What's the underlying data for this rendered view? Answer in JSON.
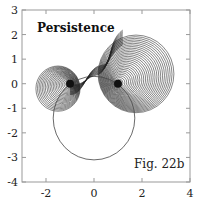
{
  "chart_data": {
    "type": "line",
    "title": "Persistence",
    "annotation": "Fig. 22b",
    "xlabel": "",
    "ylabel": "",
    "xlim": [
      -3,
      4
    ],
    "ylim": [
      -4,
      3
    ],
    "x_ticks": [
      -2,
      0,
      2,
      4
    ],
    "x_tick_labels": [
      "-2",
      "0",
      "2",
      "4"
    ],
    "y_ticks": [
      3,
      2,
      1,
      0,
      -1,
      -2,
      -3,
      -4
    ],
    "y_tick_labels": [
      "3",
      "2",
      "1",
      "0",
      "-1",
      "-2",
      "-3",
      "-4"
    ],
    "grid": false,
    "legend": null,
    "series": [
      {
        "name": "right-vortex-circle-family",
        "count": 30,
        "start": {
          "cx": 1.0,
          "cy": 0.0,
          "r": 0.05
        },
        "end": {
          "cx": 1.75,
          "cy": 0.4,
          "r": 1.58
        }
      },
      {
        "name": "left-vortex-circle-family",
        "count": 22,
        "start": {
          "cx": -1.0,
          "cy": 0.0,
          "r": 0.05
        },
        "end": {
          "cx": -1.5,
          "cy": -0.2,
          "r": 0.92
        }
      },
      {
        "name": "large-circle",
        "cx": 0.0,
        "cy": -1.4,
        "r": 1.7
      }
    ],
    "vortex_points": [
      {
        "x": -1.0,
        "y": 0.0
      },
      {
        "x": 1.0,
        "y": 0.0
      }
    ]
  },
  "labels": {
    "title": "Persistence",
    "figure": "Fig. 22b"
  }
}
